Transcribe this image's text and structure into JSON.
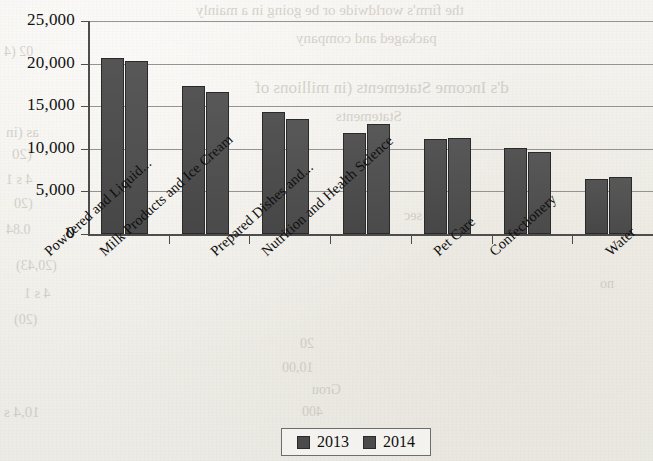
{
  "chart_data": {
    "type": "bar",
    "title": "",
    "xlabel": "",
    "ylabel": "",
    "ylim": [
      0,
      25000
    ],
    "yticks": [
      "0",
      "5,000",
      "10,000",
      "15,000",
      "20,000",
      "25,000"
    ],
    "ytick_values": [
      0,
      5000,
      10000,
      15000,
      20000,
      25000
    ],
    "grid": true,
    "legend_position": "bottom",
    "categories": [
      "Powdered and Liquid...",
      "Milk Products and Ice Cream",
      "Prepared Dishes and...",
      "Nutrition and Health Science",
      "Pet Care",
      "Confectionery",
      "Water"
    ],
    "series": [
      {
        "name": "2013",
        "color": "#4b4b4b",
        "values": [
          20600,
          17400,
          14300,
          11800,
          11200,
          10100,
          6500
        ]
      },
      {
        "name": "2014",
        "color": "#4f4f4f",
        "values": [
          20300,
          16700,
          13500,
          12900,
          11250,
          9650,
          6650
        ]
      }
    ]
  },
  "legend": {
    "items": [
      {
        "label": "2013"
      },
      {
        "label": "2014"
      }
    ]
  },
  "background_bleed": [
    {
      "text": "the firm's worldwide or be going in a mainly",
      "x": 196,
      "y": 2,
      "size": 15
    },
    {
      "text": "packaged and company",
      "x": 296,
      "y": 30,
      "size": 15
    },
    {
      "text": "d's Income Statements (in millions of",
      "x": 255,
      "y": 78,
      "size": 17
    },
    {
      "text": "Statements",
      "x": 336,
      "y": 108,
      "size": 15
    },
    {
      "text": "as (in",
      "x": 6,
      "y": 124,
      "size": 15
    },
    {
      "text": "(20",
      "x": 12,
      "y": 146,
      "size": 15
    },
    {
      "text": "4 s 1",
      "x": 6,
      "y": 172,
      "size": 14
    },
    {
      "text": "(20",
      "x": 14,
      "y": 196,
      "size": 14
    },
    {
      "text": "0.84",
      "x": 6,
      "y": 222,
      "size": 14
    },
    {
      "text": "10,4 s",
      "x": 4,
      "y": 404,
      "size": 15
    },
    {
      "text": "20",
      "x": 300,
      "y": 336,
      "size": 14
    },
    {
      "text": "10,00",
      "x": 282,
      "y": 360,
      "size": 14
    },
    {
      "text": "Grou",
      "x": 312,
      "y": 382,
      "size": 14
    },
    {
      "text": "400",
      "x": 302,
      "y": 404,
      "size": 14
    },
    {
      "text": "02 (4",
      "x": 4,
      "y": 44,
      "size": 14
    },
    {
      "text": "(20,43)",
      "x": 16,
      "y": 258,
      "size": 14
    },
    {
      "text": "4 s 1",
      "x": 24,
      "y": 286,
      "size": 14
    },
    {
      "text": "(20)",
      "x": 14,
      "y": 312,
      "size": 14
    },
    {
      "text": "no",
      "x": 600,
      "y": 276,
      "size": 14
    },
    {
      "text": "sec",
      "x": 404,
      "y": 208,
      "size": 14
    }
  ]
}
